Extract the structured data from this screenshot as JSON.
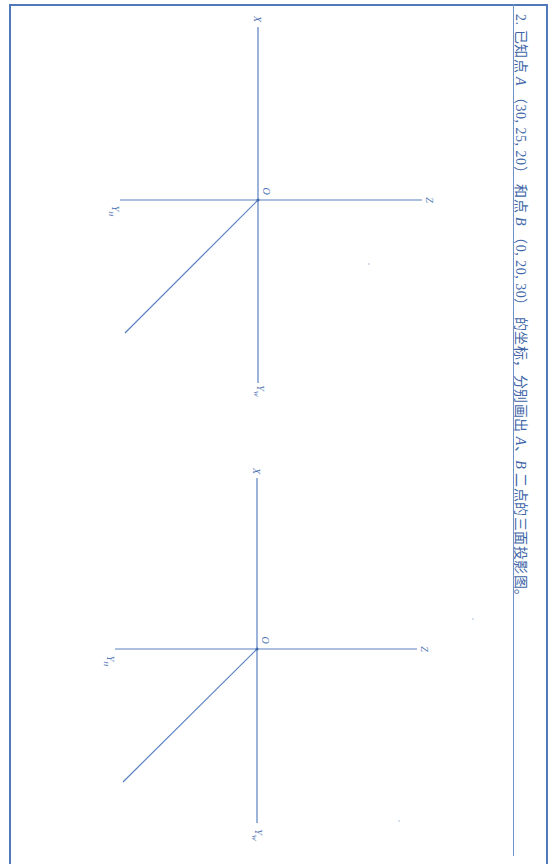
{
  "question": {
    "number": "2.",
    "text_part1": "已知点",
    "point_a": "A",
    "coords_a": "（30, 25, 20）",
    "text_part2": "和点",
    "point_b": "B",
    "coords_b": "（0, 20, 30）",
    "text_part3": "的坐标，分别画出",
    "point_a2": "A",
    "separator": "、",
    "point_b2": "B",
    "text_part4": "二点的三面投影图。"
  },
  "diagrams": [
    {
      "id": "diagram-point-a",
      "labels": {
        "x": "X",
        "origin": "O",
        "z": "Z",
        "yh": "Y",
        "yh_sub": "H",
        "yw": "Y",
        "yw_sub": "W"
      }
    },
    {
      "id": "diagram-point-b",
      "labels": {
        "x": "X",
        "origin": "O",
        "z": "Z",
        "yh": "Y",
        "yh_sub": "H",
        "yw": "Y",
        "yw_sub": "W"
      }
    }
  ],
  "colors": {
    "line": "#5b80c0",
    "border": "#4f79b8",
    "text": "#3e66a8"
  }
}
